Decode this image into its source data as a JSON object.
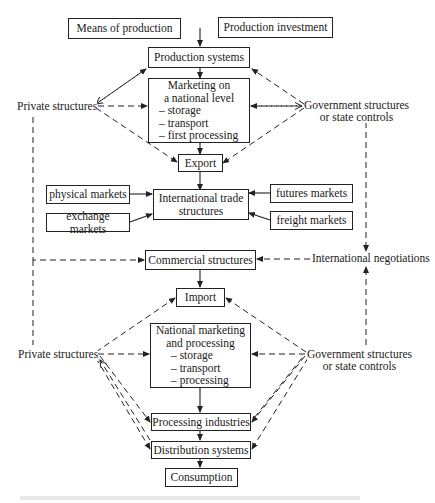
{
  "diagram": {
    "inputs": {
      "means": "Means of production",
      "investment": "Production investment"
    },
    "production_systems": "Production systems",
    "marketing_national": {
      "title1": "Marketing on",
      "title2": "a national level",
      "items": [
        "– storage",
        "– transport",
        "– first processing"
      ]
    },
    "export": "Export",
    "international_trade": {
      "line1": "International trade",
      "line2": "structures"
    },
    "markets": {
      "physical": "physical markets",
      "exchange": "exchange markets",
      "futures": "futures markets",
      "freight": "freight markets"
    },
    "commercial_structures": "Commercial structures",
    "international_negotiations": "International negotiations",
    "import": "Import",
    "national_processing": {
      "title1": "National marketing",
      "title2": "and processing",
      "items": [
        "– storage",
        "– transport",
        "– processing"
      ]
    },
    "processing_industries": "Processing industries",
    "distribution_systems": "Distribution systems",
    "consumption": "Consumption",
    "private_top": "Private structures",
    "private_bottom": "Private structures",
    "government_top": {
      "line1": "Government  structures",
      "line2": "or state controls"
    },
    "government_bottom": {
      "line1": "Government  structures",
      "line2": "or state controls"
    }
  }
}
